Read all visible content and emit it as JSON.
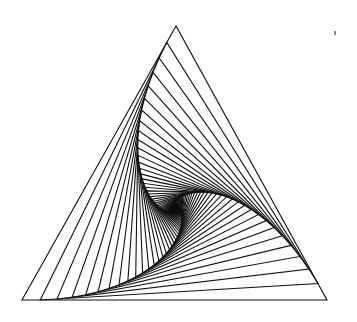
{
  "figure": {
    "type": "nested-rotating-triangles",
    "outer_triangle": {
      "apex": [
        176,
        26
      ],
      "bottom_left": [
        22,
        300
      ],
      "bottom_right": [
        327,
        300
      ]
    },
    "step_fraction": 0.06,
    "iterations": 90,
    "stroke_color": "#111111",
    "stroke_width": 1.1,
    "background": "#ffffff",
    "speck": {
      "x": 334,
      "y": 31
    }
  }
}
